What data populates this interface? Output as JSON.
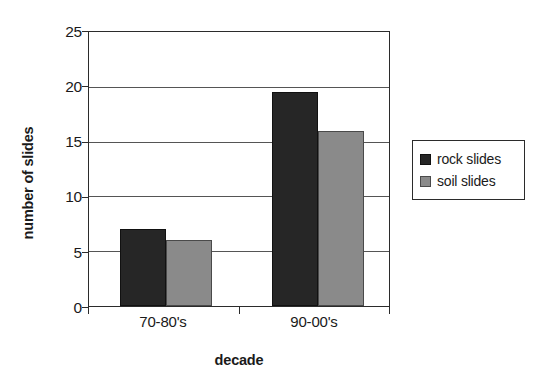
{
  "chart_data": {
    "type": "bar",
    "title": "",
    "xlabel": "decade",
    "ylabel": "number of slides",
    "categories": [
      "70-80's",
      "90-00's"
    ],
    "series": [
      {
        "name": "rock slides",
        "values": [
          7,
          19.5
        ],
        "color": "#262626"
      },
      {
        "name": "soil slides",
        "values": [
          6,
          16
        ],
        "color": "#8a8a8a"
      }
    ],
    "ylim": [
      0,
      25
    ],
    "yticks": [
      0,
      5,
      10,
      15,
      20,
      25
    ],
    "ytick_labels": [
      "0",
      "5",
      "10",
      "15",
      "20",
      "25"
    ],
    "grid": true,
    "grid_axis": "y",
    "legend_position": "right",
    "legend_entries": [
      "rock slides",
      "soil slides"
    ]
  },
  "axes": {
    "y_title": "number of slides",
    "x_title": "decade",
    "y_tick_0": "0",
    "y_tick_1": "5",
    "y_tick_2": "10",
    "y_tick_3": "15",
    "y_tick_4": "20",
    "y_tick_5": "25",
    "x_tick_0": "70-80's",
    "x_tick_1": "90-00's"
  },
  "legend": {
    "entry_0_label": "rock slides",
    "entry_1_label": "soil slides",
    "entry_0_swatch": "rock-slides-swatch-icon",
    "entry_1_swatch": "soil-slides-swatch-icon"
  }
}
